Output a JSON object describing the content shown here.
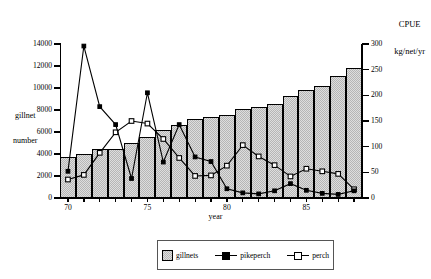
{
  "chart_data": {
    "type": "bar",
    "title": "",
    "subtitle": "",
    "xlabel": "year",
    "ylabel": "gillnet number",
    "y2label": "CPUE kg/net/yr",
    "y2label_line1": "CPUE",
    "y2label_line2": "kg/net/yr",
    "grid": false,
    "legend_position": "bottom",
    "ylim": [
      0,
      14000
    ],
    "y2lim": [
      0,
      300
    ],
    "yticks": [
      0,
      2000,
      4000,
      6000,
      8000,
      10000,
      12000,
      14000
    ],
    "y2ticks": [
      0,
      50,
      100,
      150,
      200,
      250,
      300
    ],
    "xlim": [
      69.5,
      88.5
    ],
    "xticks": [
      70,
      75,
      80,
      85
    ],
    "xticklabels": [
      "70",
      "75",
      "80",
      "85"
    ],
    "categories": [
      70,
      71,
      72,
      73,
      74,
      75,
      76,
      77,
      78,
      79,
      80,
      81,
      82,
      83,
      84,
      85,
      86,
      87,
      88
    ],
    "series": [
      {
        "name": "gillnets",
        "type": "bar",
        "axis": "left",
        "unit": "gillnet number",
        "values": [
          3750,
          4000,
          4450,
          4500,
          5000,
          5550,
          6200,
          6600,
          7150,
          7400,
          7550,
          8050,
          8300,
          8550,
          9250,
          9800,
          10200,
          11050,
          11800
        ]
      },
      {
        "name": "pikeperch",
        "type": "line",
        "marker": "filled-square",
        "axis": "right",
        "unit": "CPUE kg/net/yr",
        "values": [
          52,
          296,
          178,
          143,
          38,
          205,
          70,
          143,
          80,
          71,
          18,
          10,
          8,
          14,
          28,
          15,
          9,
          7,
          14
        ]
      },
      {
        "name": "perch",
        "type": "line",
        "marker": "open-square",
        "axis": "right",
        "unit": "CPUE kg/net/yr",
        "values": [
          36,
          45,
          88,
          128,
          150,
          145,
          115,
          78,
          43,
          44,
          63,
          103,
          81,
          64,
          42,
          57,
          52,
          47,
          17
        ]
      }
    ],
    "legend": [
      {
        "label": "gillnets",
        "marker": "bar-swatch"
      },
      {
        "label": "pikeperch",
        "marker": "filled-square-line"
      },
      {
        "label": "perch",
        "marker": "open-square-line"
      }
    ],
    "colors": {
      "bar_fill": "#b6b6b6",
      "axis": "#000000",
      "line": "#000000",
      "background": "#ffffff"
    }
  }
}
